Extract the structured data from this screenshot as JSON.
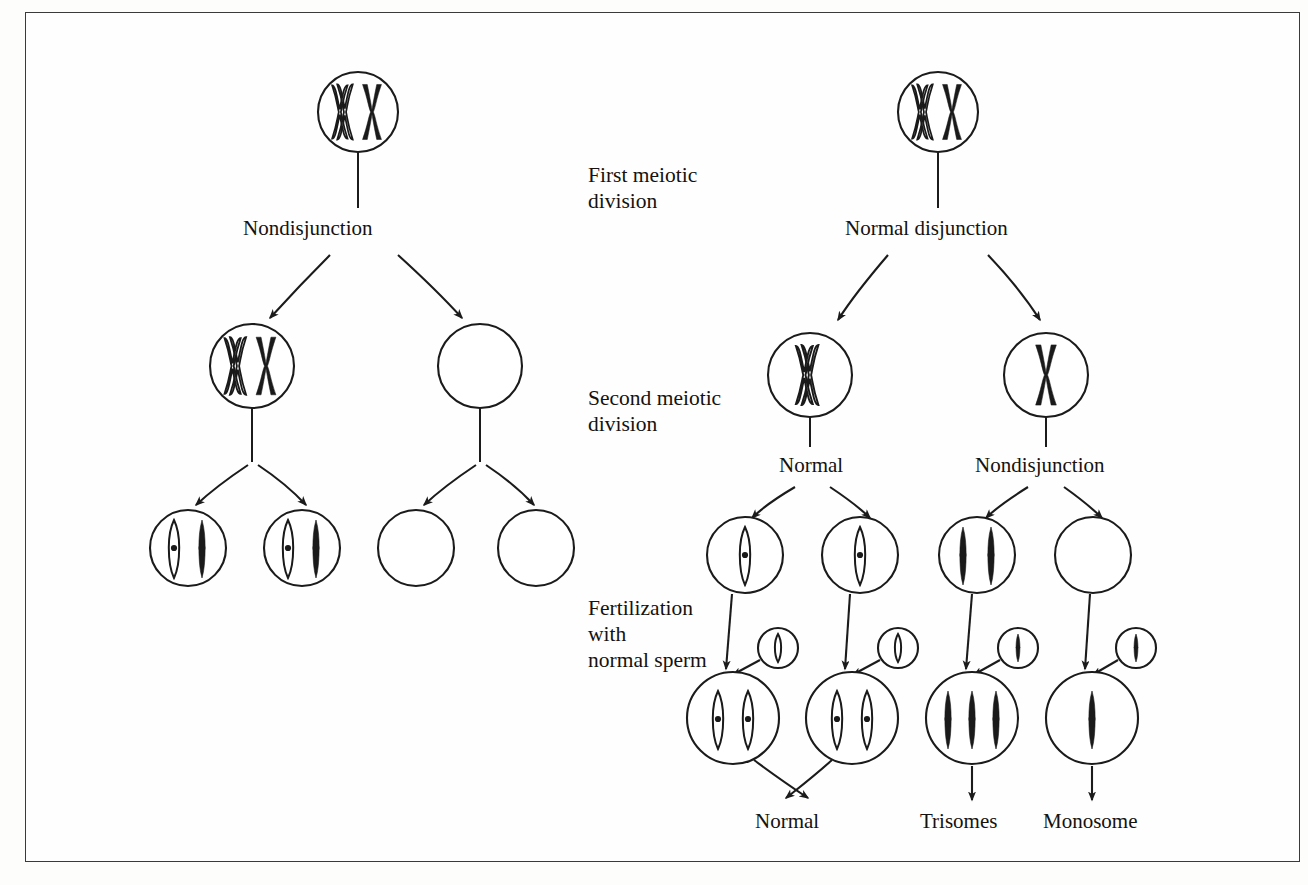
{
  "figure": {
    "background_color": "#fdfdfb",
    "frame_color": "#3a3a3a",
    "ink_color": "#1a1a1a"
  },
  "stage_labels": {
    "first_division": "First meiotic\ndivision",
    "first_division_line1": "First meiotic",
    "first_division_line2": "division",
    "second_division_line1": "Second meiotic",
    "second_division_line2": "division",
    "fertilization_line1": "Fertilization",
    "fertilization_line2": "with",
    "fertilization_line3": "normal sperm"
  },
  "left_branch": {
    "name": "nondisjunction-at-first-division",
    "first_division_label": "Nondisjunction",
    "parent_cell": {
      "chromosomes": 2,
      "type": "X-shaped replicated pair"
    },
    "daughter_cells": [
      {
        "label": "",
        "chromosomes": 2,
        "type": "X-shaped"
      },
      {
        "label": "",
        "chromosomes": 0,
        "type": "empty"
      }
    ],
    "gametes": [
      {
        "chromosomes": 2,
        "types": [
          "open-rod",
          "solid-rod"
        ]
      },
      {
        "chromosomes": 2,
        "types": [
          "open-rod",
          "solid-rod"
        ]
      },
      {
        "chromosomes": 0,
        "types": []
      },
      {
        "chromosomes": 0,
        "types": []
      }
    ]
  },
  "right_branch": {
    "name": "nondisjunction-at-second-division",
    "first_division_label": "Normal disjunction",
    "second_division_labels": [
      "Normal",
      "Nondisjunction"
    ],
    "parent_cell": {
      "chromosomes": 2,
      "type": "X-shaped replicated pair"
    },
    "daughter_cells": [
      {
        "label": "Normal",
        "chromosomes": 1,
        "type": "open-X"
      },
      {
        "label": "Nondisjunction",
        "chromosomes": 1,
        "type": "solid-X"
      }
    ],
    "gametes": [
      {
        "chromosomes": 1,
        "types": [
          "open-rod"
        ]
      },
      {
        "chromosomes": 1,
        "types": [
          "open-rod"
        ]
      },
      {
        "chromosomes": 2,
        "types": [
          "solid-rod",
          "solid-rod"
        ]
      },
      {
        "chromosomes": 0,
        "types": []
      }
    ],
    "sperm_cells": [
      {
        "chromosomes": 1,
        "type": "open-rod"
      },
      {
        "chromosomes": 1,
        "type": "open-rod"
      },
      {
        "chromosomes": 1,
        "type": "solid-rod"
      },
      {
        "chromosomes": 1,
        "type": "solid-rod"
      }
    ],
    "zygotes": [
      {
        "chromosomes": 2,
        "types": [
          "open-rod",
          "open-rod"
        ],
        "outcome": "Normal"
      },
      {
        "chromosomes": 2,
        "types": [
          "open-rod",
          "open-rod"
        ],
        "outcome": "Normal"
      },
      {
        "chromosomes": 3,
        "types": [
          "solid-rod",
          "solid-rod",
          "solid-rod"
        ],
        "outcome": "Trisomes"
      },
      {
        "chromosomes": 1,
        "types": [
          "solid-rod"
        ],
        "outcome": "Monosome"
      }
    ],
    "outcome_labels": [
      "Normal",
      "Trisomes",
      "Monosome"
    ]
  }
}
